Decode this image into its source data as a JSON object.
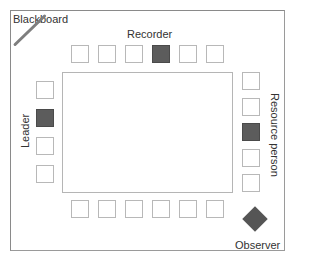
{
  "diagram": {
    "labels": {
      "blackboard": "Blackboard",
      "recorder": "Recorder",
      "leader": "Leader",
      "resource_person": "Resource person",
      "observer": "Observer"
    },
    "seats": {
      "top": [
        false,
        false,
        false,
        true,
        false,
        false
      ],
      "left": [
        false,
        true,
        false,
        false
      ],
      "right": [
        false,
        false,
        true,
        false,
        false
      ],
      "bottom": [
        false,
        false,
        false,
        false,
        false,
        false
      ]
    },
    "legend_meaning": {
      "filled": "role position",
      "empty": "participant"
    },
    "colors": {
      "filled_seat": "#5c5c5c",
      "empty_seat_border": "#b8b8b8",
      "observer": "#555555",
      "blackboard": "#7e7e7e"
    }
  }
}
